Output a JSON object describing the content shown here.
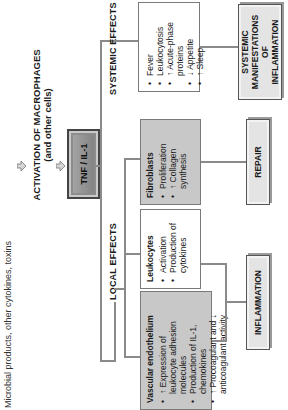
{
  "stimulus": {
    "text": "Microbial products, other cytokines, toxins",
    "arrow_icon": "down-arrow"
  },
  "activation": {
    "title": "ACTIVATION OF MACROPHAGES",
    "subtitle": "(and other cells)",
    "arrow_icon": "down-arrow"
  },
  "mediator": {
    "label": "TNF / IL-1"
  },
  "branches": {
    "local": {
      "label": "LOCAL EFFECTS",
      "targets": [
        {
          "title": "Vascular endothelium",
          "style": "gray",
          "items": [
            "↑ Expression of leukocyte adhesion molecules",
            "Production of IL-1, chemokines",
            "↑ Procoagulant and ↓ anticoagulant activity"
          ]
        },
        {
          "title": "Leukocytes",
          "style": "white",
          "items": [
            "Activation",
            "Production of cytokines"
          ]
        },
        {
          "title": "Fibroblasts",
          "style": "gray",
          "items": [
            "Proliferation",
            "↑ Collagen synthesis"
          ]
        }
      ],
      "outcomes": [
        "INFLAMMATION",
        "REPAIR"
      ]
    },
    "systemic": {
      "label": "SYSTEMIC EFFECTS",
      "items": [
        "Fever",
        "Leukocytosis",
        "↑ Acute-phase proteins",
        "↓ Appetite",
        "↑ Sleep"
      ],
      "outcome": "SYSTEMIC MANIFESTATIONS OF INFLAMMATION"
    }
  },
  "colors": {
    "line": "#8a8a8a",
    "gray_box": "#c8c8c8",
    "outcome_box": "#e4e4e4",
    "mediator_box": "#999999"
  }
}
